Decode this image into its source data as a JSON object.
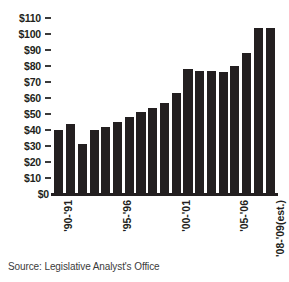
{
  "chart_data": {
    "type": "bar",
    "title": "",
    "subtitle": "",
    "xlabel": "",
    "ylabel": "",
    "ylim": [
      0,
      110
    ],
    "ytick_step": 10,
    "grid": false,
    "legend": null,
    "bar_color": "#231f20",
    "background_color": "#ffffff",
    "value_prefix": "$",
    "ytick_labels": [
      "$110",
      "$100",
      "$90",
      "$80",
      "$70",
      "$60",
      "$50",
      "$40",
      "$30",
      "$20",
      "$10",
      "$0"
    ],
    "ytick_values": [
      110,
      100,
      90,
      80,
      70,
      60,
      50,
      40,
      30,
      20,
      10,
      0
    ],
    "categories": [
      "'90-'91",
      "'91-'92",
      "'92-'93",
      "'93-'94",
      "'94-'95",
      "'95-'96",
      "'96-'97",
      "'97-'98",
      "'98-'99",
      "'99-'00",
      "'00-'01",
      "'01-'02",
      "'02-'03",
      "'03-'04",
      "'04-'05",
      "'05-'06",
      "'06-'07",
      "'07-'08",
      "'08-'09(est.)"
    ],
    "values": [
      40,
      44,
      31,
      40,
      42,
      45,
      48,
      51,
      54,
      57,
      63,
      78,
      77,
      77,
      76,
      80,
      88,
      104,
      104
    ],
    "xtick_labels_shown": [
      "'90-'91",
      "'95-'96",
      "'00-'01",
      "'05-'06",
      "'08-'09(est.)"
    ],
    "xtick_label_indices": [
      0,
      5,
      10,
      15,
      18
    ]
  },
  "source": {
    "text": "Source: Legislative Analyst's Office"
  }
}
